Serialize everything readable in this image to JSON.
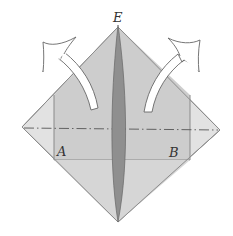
{
  "diagram": {
    "type": "origami-fold-step",
    "labels": {
      "top": "E",
      "left": "A",
      "right": "B"
    },
    "colors": {
      "paper_light": "#dcdcdc",
      "paper_mid": "#c4c4c4",
      "spine": "#8a8a8a",
      "outline": "#888888",
      "arrow_fill": "#ffffff",
      "arrow_stroke": "#666666"
    },
    "arrows": [
      {
        "name": "left-arrow",
        "direction": "up-left"
      },
      {
        "name": "right-arrow",
        "direction": "up-right"
      }
    ],
    "fold_line": {
      "style": "dash-dot",
      "orientation": "horizontal"
    }
  }
}
